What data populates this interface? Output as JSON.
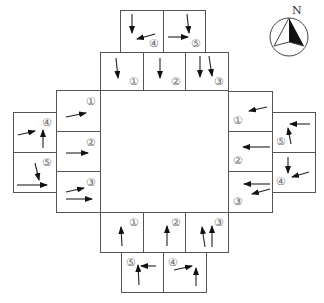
{
  "colors": {
    "line": "#555555",
    "arrow": "#222222",
    "label": "#666666"
  },
  "compass": {
    "label": "N"
  },
  "approaches": {
    "north": {
      "inner": [
        {
          "label": "①",
          "movements": [
            "through-right"
          ]
        },
        {
          "label": "②",
          "movements": [
            "through"
          ]
        },
        {
          "label": "③",
          "movements": [
            "through",
            "through-right"
          ]
        }
      ],
      "outer": [
        {
          "label": "④",
          "movements": [
            "through",
            "left-from-east"
          ]
        },
        {
          "label": "⑤",
          "movements": [
            "right-from-north",
            "through-from-west"
          ]
        }
      ]
    },
    "west": {
      "inner": [
        {
          "label": "①",
          "movements": [
            "left-turn-slight"
          ]
        },
        {
          "label": "②",
          "movements": [
            "through"
          ]
        },
        {
          "label": "③",
          "movements": [
            "left-turn-slight",
            "through"
          ]
        }
      ],
      "outer": [
        {
          "label": "④",
          "movements": [
            "left-turn-slight",
            "through-north"
          ]
        },
        {
          "label": "⑤",
          "movements": [
            "right-from-north",
            "through-east"
          ]
        }
      ]
    },
    "east": {
      "inner": [
        {
          "label": "①",
          "movements": [
            "left-turn-slight"
          ]
        },
        {
          "label": "②",
          "movements": [
            "through"
          ]
        },
        {
          "label": "③",
          "movements": [
            "through",
            "left-turn-slight"
          ]
        }
      ],
      "outer": [
        {
          "label": "⑤",
          "movements": [
            "through-from-east",
            "left-from-south"
          ]
        },
        {
          "label": "④",
          "movements": [
            "through-south",
            "left-turn-slight"
          ]
        }
      ]
    },
    "south": {
      "inner": [
        {
          "label": "①",
          "movements": [
            "through-left"
          ]
        },
        {
          "label": "②",
          "movements": [
            "through"
          ]
        },
        {
          "label": "③",
          "movements": [
            "through-left",
            "through"
          ]
        }
      ],
      "outer": [
        {
          "label": "⑤",
          "movements": [
            "through-from-east",
            "left-from-south"
          ]
        },
        {
          "label": "④",
          "movements": [
            "left-from-west",
            "through"
          ]
        }
      ]
    }
  }
}
